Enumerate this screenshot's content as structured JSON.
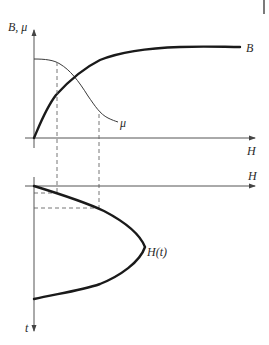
{
  "diagram": {
    "type": "magnetization-diagram",
    "top_panel": {
      "y_axis_label": "B, μ",
      "x_axis_label": "H",
      "curves": [
        {
          "name": "B",
          "label": "B",
          "description": "magnetization curve, rises steeply then saturates",
          "stroke": "#1a1a1a",
          "weight": "bold"
        },
        {
          "name": "mu",
          "label": "μ",
          "description": "permeability, flat then decreasing",
          "stroke": "#3a3a3a",
          "weight": "thin"
        }
      ]
    },
    "bottom_panel": {
      "x_axis_label": "H",
      "y_axis_label": "t",
      "curves": [
        {
          "name": "H(t)",
          "label": "H(t)",
          "description": "field vs time, half-period pulse (axis t pointing down)",
          "stroke": "#1a1a1a",
          "weight": "bold"
        }
      ]
    },
    "projection_lines": {
      "style": "dashed",
      "count_vertical": 2,
      "count_horizontal": 2
    }
  },
  "colors": {
    "axis": "#555555",
    "curve_bold": "#1a1a1a",
    "curve_thin": "#3a3a3a",
    "dashed": "#666666",
    "background": "#ffffff"
  }
}
